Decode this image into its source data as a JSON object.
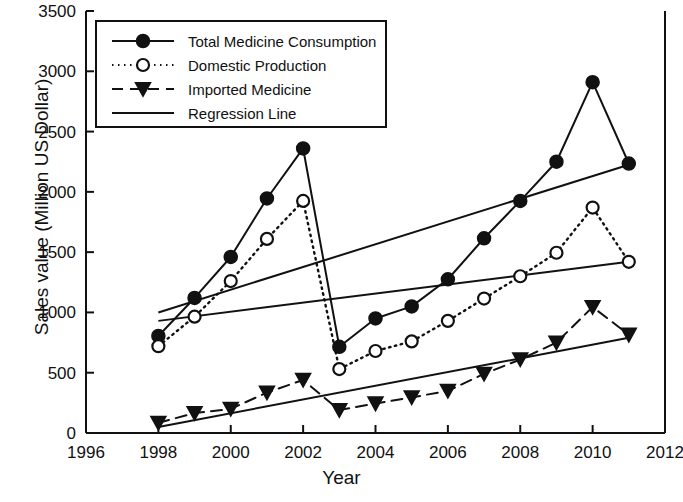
{
  "chart_data": {
    "type": "line",
    "title": "",
    "xlabel": "Year",
    "ylabel": "Sales value (Million US Dollar)",
    "xlim": [
      1996,
      2012
    ],
    "ylim": [
      0,
      3500
    ],
    "xticks": [
      1996,
      1998,
      2000,
      2002,
      2004,
      2006,
      2008,
      2010,
      2012
    ],
    "yticks": [
      0,
      500,
      1000,
      1500,
      2000,
      2500,
      3000,
      3500
    ],
    "grid": false,
    "legend_position": "top-left",
    "x": [
      1998,
      1999,
      2000,
      2001,
      2002,
      2003,
      2004,
      2005,
      2006,
      2007,
      2008,
      2009,
      2010,
      2011
    ],
    "series": [
      {
        "name": "Total Medicine Consumption",
        "marker": "filled-circle",
        "line": "solid",
        "values": [
          805,
          1120,
          1460,
          1945,
          2360,
          715,
          950,
          1050,
          1275,
          1615,
          1925,
          2250,
          2910,
          2235
        ]
      },
      {
        "name": "Domestic Production",
        "marker": "open-circle",
        "line": "dotted",
        "values": [
          720,
          965,
          1260,
          1610,
          1925,
          530,
          680,
          760,
          930,
          1115,
          1300,
          1495,
          1870,
          1420
        ]
      },
      {
        "name": "Imported Medicine",
        "marker": "filled-triangle-down",
        "line": "dashed",
        "values": [
          85,
          165,
          200,
          335,
          440,
          190,
          245,
          295,
          350,
          490,
          610,
          750,
          1045,
          815
        ]
      }
    ],
    "regression_lines": [
      {
        "name": "Regression Line (Total Medicine Consumption)",
        "x": [
          1998,
          2011
        ],
        "y": [
          1000,
          2225
        ]
      },
      {
        "name": "Regression Line (Domestic Production)",
        "x": [
          1998,
          2011
        ],
        "y": [
          930,
          1420
        ]
      },
      {
        "name": "Regression Line (Imported Medicine)",
        "x": [
          1998,
          2011
        ],
        "y": [
          50,
          790
        ]
      }
    ],
    "legend": [
      {
        "label": "Total Medicine Consumption",
        "marker": "filled-circle",
        "line": "solid"
      },
      {
        "label": "Domestic Production",
        "marker": "open-circle",
        "line": "dotted"
      },
      {
        "label": "Imported Medicine",
        "marker": "filled-triangle-down",
        "line": "dashed"
      },
      {
        "label": "Regression Line",
        "marker": "none",
        "line": "solid"
      }
    ],
    "colors": {
      "ink": "#111111",
      "background": "#ffffff"
    }
  }
}
